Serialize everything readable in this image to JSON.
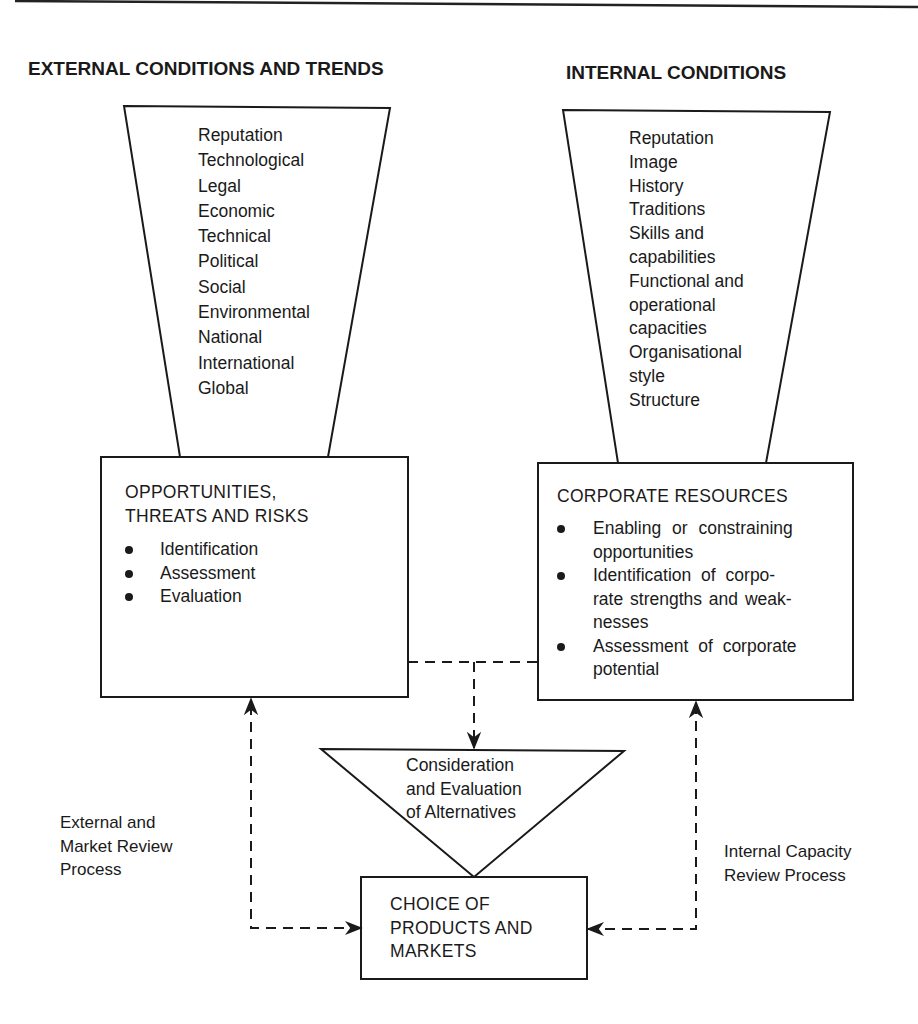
{
  "headings": {
    "external": "EXTERNAL CONDITIONS AND TRENDS",
    "internal": "INTERNAL CONDITIONS"
  },
  "external_funnel": {
    "items": [
      "Reputation",
      "Technological",
      "Legal",
      "Economic",
      "Technical",
      "Political",
      "Social",
      "Environmental",
      "National",
      "International",
      "Global"
    ]
  },
  "internal_funnel": {
    "items": [
      "Reputation",
      "Image",
      "History",
      "Traditions",
      "Skills and",
      "capabilities",
      "Functional and",
      "operational",
      "capacities",
      "Organisational",
      "style",
      "Structure"
    ]
  },
  "opportunities_box": {
    "title_line1": "OPPORTUNITIES,",
    "title_line2": "THREATS AND RISKS",
    "bullets": [
      "Identification",
      "Assessment",
      "Evaluation"
    ]
  },
  "resources_box": {
    "title": "CORPORATE RESOURCES",
    "bullets": [
      {
        "line1": "Enabling or constraining",
        "line2": "opportunities"
      },
      {
        "line1": "Identification of corpo-",
        "line2": "rate strengths and weak-",
        "line3": "nesses"
      },
      {
        "line1": "Assessment of corporate",
        "line2": "potential"
      }
    ]
  },
  "alternatives_triangle": {
    "line1": "Consideration",
    "line2": "and Evaluation",
    "line3": "of Alternatives"
  },
  "choice_box": {
    "line1": "CHOICE OF",
    "line2": "PRODUCTS AND",
    "line3": "MARKETS"
  },
  "side_labels": {
    "external_review": {
      "line1": "External and",
      "line2": "Market Review",
      "line3": "Process"
    },
    "internal_review": {
      "line1": "Internal Capacity",
      "line2": "Review Process"
    }
  },
  "colors": {
    "ink": "#1a1a1a",
    "background": "#ffffff"
  }
}
